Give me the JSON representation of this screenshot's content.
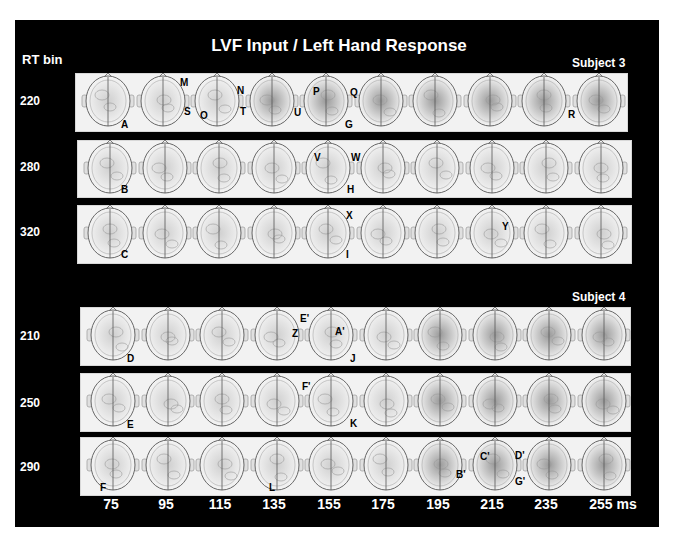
{
  "title": "LVF Input / Left Hand Response",
  "rt_bin_label": "RT bin",
  "subjects": [
    {
      "label": "Subject 3",
      "rows": [
        {
          "rt_bin": "220",
          "annotations": [
            "A",
            "M",
            "S",
            "O",
            "N",
            "T",
            "U",
            "P",
            "Q",
            "G",
            "R"
          ]
        },
        {
          "rt_bin": "280",
          "annotations": [
            "B",
            "V",
            "W",
            "H"
          ]
        },
        {
          "rt_bin": "320",
          "annotations": [
            "C",
            "X",
            "I",
            "Y"
          ]
        }
      ]
    },
    {
      "label": "Subject 4",
      "rows": [
        {
          "rt_bin": "210",
          "annotations": [
            "D",
            "Z",
            "E'",
            "A'",
            "J"
          ]
        },
        {
          "rt_bin": "250",
          "annotations": [
            "E",
            "F'",
            "K"
          ]
        },
        {
          "rt_bin": "290",
          "annotations": [
            "F",
            "L",
            "B'",
            "C'",
            "D'",
            "G'"
          ]
        }
      ]
    }
  ],
  "time_axis": {
    "labels": [
      "75",
      "95",
      "115",
      "135",
      "155",
      "175",
      "195",
      "215",
      "235",
      "255 ms"
    ],
    "unit": "ms"
  },
  "colors": {
    "background": "#000000",
    "panel": "#f2f2f2",
    "text": "#ffffff"
  }
}
